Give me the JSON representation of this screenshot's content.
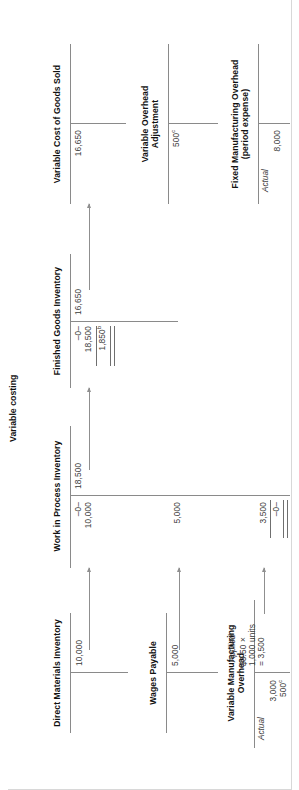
{
  "figure": {
    "title": "Variable costing",
    "orientation": "rotated-90-ccw"
  },
  "accounts": [
    {
      "id": "direct-materials-inventory",
      "name": "Direct Materials Inventory",
      "credits": [
        {
          "value": "10,000"
        }
      ]
    },
    {
      "id": "wages-payable",
      "name": "Wages Payable",
      "credits": [
        {
          "value": "5,000"
        }
      ]
    },
    {
      "id": "variable-manufacturing-overhead",
      "name": "Variable Manufacturing Overhead",
      "debit_label": "Actual",
      "debits": [
        {
          "value": "3,000"
        },
        {
          "value": "500",
          "sup": "c"
        }
      ],
      "credit_label": "Applied",
      "credits": [
        {
          "value": "$3.50 ×"
        },
        {
          "value": "1,000 units"
        },
        {
          "value": "= 3,500"
        }
      ]
    },
    {
      "id": "work-in-process-inventory",
      "name": "Work in Process Inventory",
      "debits": [
        {
          "value": "–0–"
        },
        {
          "value": "10,000"
        },
        {
          "value": "5,000"
        },
        {
          "value": "3,500"
        }
      ],
      "credits": [
        {
          "value": "18,500"
        }
      ],
      "balance": "–0–"
    },
    {
      "id": "finished-goods-inventory",
      "name": "Finished Goods Inventory",
      "debits": [
        {
          "value": "–0–"
        },
        {
          "value": "18,500"
        }
      ],
      "credits": [
        {
          "value": "16,650"
        }
      ],
      "balance": "1,850",
      "balance_sup": "b"
    },
    {
      "id": "variable-cost-of-goods-sold",
      "name": "Variable Cost of Goods Sold",
      "debits": [
        {
          "value": "16,650"
        }
      ]
    },
    {
      "id": "variable-overhead-adjustment",
      "name": "Variable Overhead Adjustment",
      "debits": [
        {
          "value": "500",
          "sup": "c"
        }
      ]
    },
    {
      "id": "fixed-manufacturing-overhead",
      "name": "Fixed Manufacturing Overhead (period expense)",
      "name_line1": "Fixed Manufacturing Overhead",
      "name_line2": "(period expense)",
      "debit_label": "Actual",
      "debits": [
        {
          "value": "8,000"
        }
      ]
    }
  ],
  "labels": {
    "dm_credit": "10,000",
    "wp_credit": "5,000",
    "vmoh_actual": "Actual",
    "vmoh_actual_1": "3,000",
    "vmoh_actual_2": "500",
    "vmoh_actual_2_sup": "c",
    "vmoh_applied": "Applied",
    "vmoh_applied_1": "$3.50 ×",
    "vmoh_applied_2": "1,000 units",
    "vmoh_applied_3": "= 3,500",
    "wip_title": "Work in Process Inventory",
    "wip_beg": "–0–",
    "wip_d1": "10,000",
    "wip_d2": "5,000",
    "wip_d3": "3,500",
    "wip_end": "–0–",
    "wip_credit": "18,500",
    "fg_title": "Finished Goods Inventory",
    "fg_beg": "–0–",
    "fg_d1": "18,500",
    "fg_credit": "16,650",
    "fg_bal": "1,850",
    "fg_bal_sup": "b",
    "vcogs_title": "Variable Cost of Goods Sold",
    "vcogs_d1": "16,650",
    "voa_title_1": "Variable Overhead",
    "voa_title_2": "Adjustment",
    "voa_d1": "500",
    "voa_d1_sup": "c",
    "fmoh_title_1": "Fixed Manufacturing Overhead",
    "fmoh_title_2": "(period expense)",
    "fmoh_actual": "Actual",
    "fmoh_d1": "8,000",
    "dm_title": "Direct Materials Inventory",
    "wp_title": "Wages Payable",
    "vmoh_title_1": "Variable Manufacturing",
    "vmoh_title_2": "Overhead"
  },
  "colors": {
    "text": "#1c1c1c",
    "amount": "#3a3a3a",
    "rule": "#8a8a8a",
    "background": "#ffffff"
  }
}
